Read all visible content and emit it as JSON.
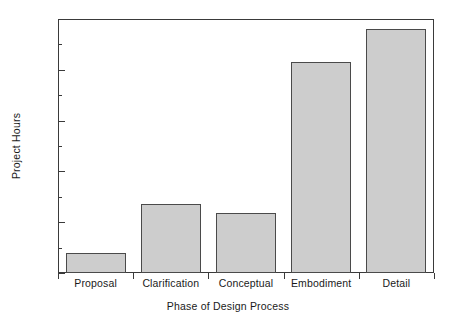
{
  "chart_data": {
    "type": "bar",
    "title": "",
    "subtitle": "",
    "xlabel": "Phase of Design Process",
    "ylabel": "Project Hours",
    "categories": [
      "Proposal",
      "Clarification",
      "Conceptual",
      "Embodiment",
      "Detail"
    ],
    "values": [
      80,
      270,
      235,
      830,
      960
    ],
    "ylim": [
      0,
      1000
    ],
    "ytick_labels": [
      "0",
      "200",
      "400",
      "600",
      "800",
      "1000"
    ],
    "ytick_values": [
      0,
      200,
      400,
      600,
      800,
      1000
    ],
    "yminor_values": [
      100,
      300,
      500,
      700,
      900
    ],
    "grid": false,
    "legend": false,
    "legend_position": "none",
    "bar_fill_color": "#cdcdcd",
    "bar_edge_color": "#4a4a4a",
    "axis_color": "#3a3a3a",
    "background_color": "#ffffff"
  }
}
